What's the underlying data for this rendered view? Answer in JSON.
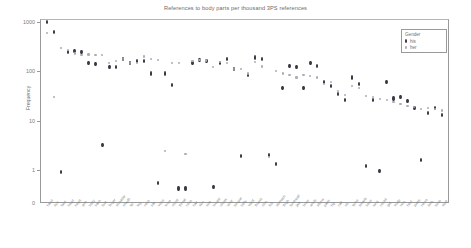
{
  "chart_data": {
    "type": "scatter",
    "title": "References to body parts per thousand 3PS references",
    "xlabel": "",
    "ylabel": "Frequency",
    "yscale": "log",
    "ylim": [
      0.5,
      1400
    ],
    "yticks": [
      1000,
      100,
      10,
      1,
      0
    ],
    "ytick_labels": [
      "1000",
      "100",
      "10",
      "1",
      "0"
    ],
    "grid": false,
    "legend": {
      "title": "Gender",
      "position": "top-right",
      "entries": [
        {
          "label": "his",
          "marker": "filled-diamond",
          "color": "#3a3a46"
        },
        {
          "label": "her",
          "marker": "small-dot",
          "color": "#adadb5"
        }
      ]
    },
    "categories": [
      "hand",
      "eye",
      "face",
      "head",
      "heart",
      "arm",
      "body",
      "back",
      "foot",
      "finger",
      "shoulder",
      "mouth",
      "lip",
      "leg",
      "neck",
      "ear",
      "voice",
      "knee",
      "chest",
      "throat",
      "nose",
      "hair",
      "skin",
      "side",
      "breast",
      "cheek",
      "wrist",
      "tongue",
      "belly",
      "waist",
      "thumb",
      "chin",
      "fist",
      "stomach",
      "thigh",
      "forehead",
      "jaw",
      "brow",
      "ankle",
      "elbow",
      "palm",
      "hip",
      "nail",
      "rib",
      "spine",
      "temple",
      "bone",
      "lung",
      "nostril",
      "gut",
      "scalp",
      "vein",
      "heel",
      "pulse",
      "nerve",
      "limb",
      "torso",
      "skull"
    ],
    "series": [
      {
        "name": "his",
        "color": "#3a3a46",
        "values": [
          1000,
          620,
          0.9,
          250,
          255,
          250,
          150,
          140,
          3.2,
          120,
          120,
          180,
          150,
          160,
          160,
          90,
          0.55,
          90,
          52,
          0.42,
          0.42,
          150,
          170,
          160,
          0.45,
          150,
          175,
          110,
          1.9,
          85,
          190,
          175,
          2.0,
          1.3,
          45,
          130,
          120,
          45,
          150,
          130,
          60,
          50,
          35,
          26,
          75,
          55,
          1.2,
          26,
          0.95,
          60,
          28,
          30,
          25,
          18,
          1.6,
          14,
          18,
          13
        ]
      },
      {
        "name": "her",
        "color": "#adadb5",
        "values": [
          600,
          30,
          300,
          270,
          230,
          215,
          220,
          215,
          215,
          150,
          160,
          175,
          150,
          145,
          200,
          180,
          170,
          2.4,
          150,
          150,
          2.1,
          160,
          170,
          165,
          120,
          155,
          150,
          110,
          110,
          90,
          155,
          125,
          1.8,
          100,
          90,
          85,
          75,
          85,
          80,
          75,
          55,
          60,
          40,
          33,
          50,
          45,
          32,
          30,
          27,
          26,
          24,
          22,
          20,
          19,
          17,
          18,
          17,
          16
        ]
      }
    ]
  }
}
